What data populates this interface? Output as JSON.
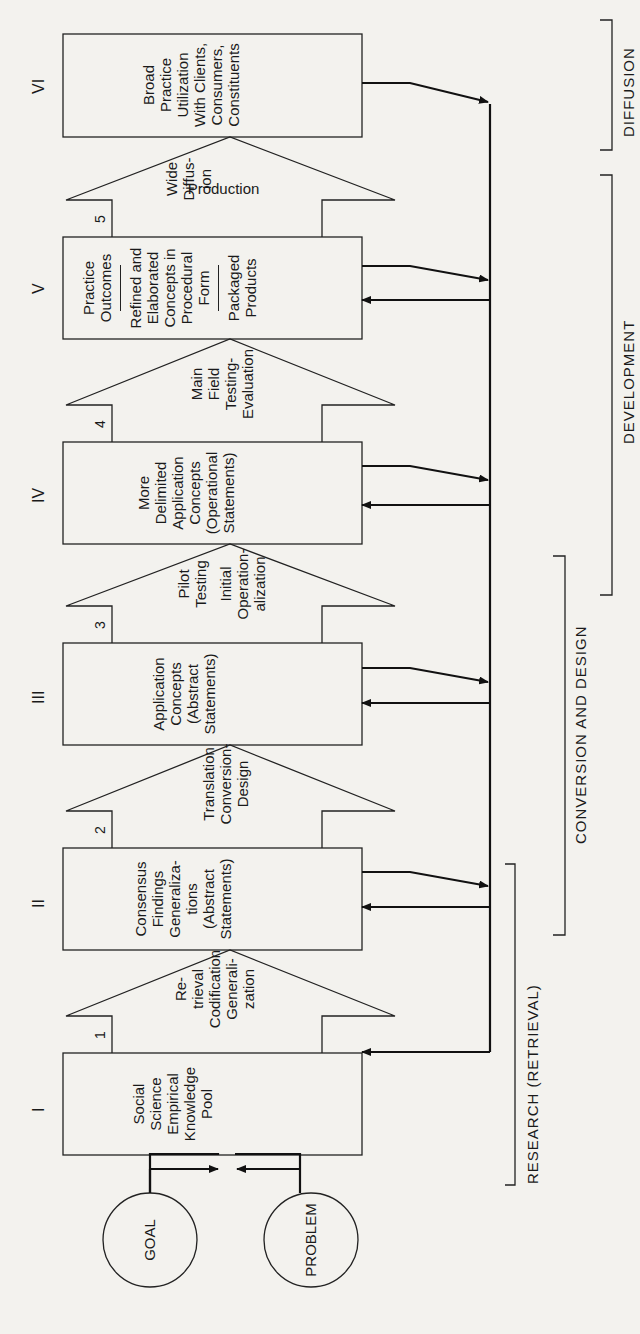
{
  "inputs": {
    "goal": "GOAL",
    "problem": "PROBLEM"
  },
  "stages": [
    {
      "roman": "I",
      "lines": [
        "Social",
        "Science",
        "Empirical",
        "Knowledge",
        "Pool"
      ]
    },
    {
      "roman": "II",
      "lines": [
        "Consensus",
        "Findings",
        "Generaliza-",
        "tions",
        "(Abstract",
        "Statements)"
      ]
    },
    {
      "roman": "III",
      "lines": [
        "Application",
        "Concepts",
        "(Abstract",
        "Statements)"
      ]
    },
    {
      "roman": "IV",
      "lines": [
        "More",
        "Delimited",
        "Application",
        "Concepts",
        "(Operational",
        "Statements)"
      ]
    },
    {
      "roman": "V",
      "top": [
        "Practice",
        "Outcomes"
      ],
      "middle": [
        "Refined and",
        "Elaborated",
        "Concepts in",
        "Procedural",
        "Form"
      ],
      "bottom": [
        "Packaged",
        "Products"
      ]
    },
    {
      "roman": "VI",
      "lines": [
        "Broad",
        "Practice",
        "Utilization",
        "With Clients,",
        "Consumers,",
        "Constituents"
      ]
    }
  ],
  "transitions": [
    {
      "number": "1",
      "top": [
        "Re-",
        "trieval"
      ],
      "middle": [
        "Codification"
      ],
      "bottom": [
        "Generali-",
        "zation"
      ]
    },
    {
      "number": "2",
      "top": [
        "Translation"
      ],
      "middle": [
        "Conversion-"
      ],
      "bottom": [
        "Design"
      ]
    },
    {
      "number": "3",
      "top": [
        "Pilot",
        "Testing"
      ],
      "middle": [
        "Initial"
      ],
      "bottom": [
        "Operation-",
        "alization"
      ]
    },
    {
      "number": "4",
      "top": [
        "Main",
        "Field"
      ],
      "middle": [
        "Testing-"
      ],
      "bottom": [
        "Evaluation"
      ]
    },
    {
      "number": "5",
      "top": [
        "Wide",
        "Diffus-",
        "ion"
      ],
      "middle": [],
      "bottom": [
        "Production"
      ]
    }
  ],
  "phases": {
    "research": "RESEARCH (RETRIEVAL)",
    "conversion": "CONVERSION AND DESIGN",
    "development": "DEVELOPMENT",
    "diffusion": "DIFFUSION"
  }
}
